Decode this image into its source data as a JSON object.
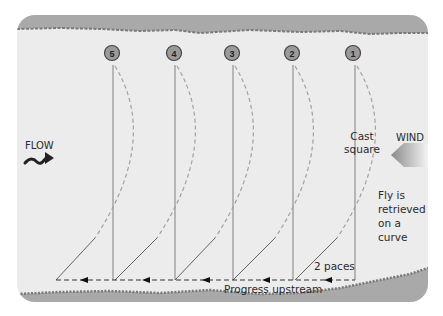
{
  "diagram": {
    "flow_label": "FLOW",
    "wind_label": "WIND",
    "cast_label_line1": "Cast",
    "cast_label_line2": "square",
    "retrieve_label_line1": "Fly is",
    "retrieve_label_line2": "retrieved",
    "retrieve_label_line3": "on a",
    "retrieve_label_line4": "curve",
    "paces_label": "2 paces",
    "progress_label": "Progress upstream",
    "positions": [
      {
        "number": "5",
        "x": 113
      },
      {
        "number": "4",
        "x": 175
      },
      {
        "number": "3",
        "x": 233
      },
      {
        "number": "2",
        "x": 293
      },
      {
        "number": "1",
        "x": 355
      }
    ],
    "colors": {
      "water": "#ececec",
      "bank": "#a9a9a9",
      "circle_fill": "#9a9a9a",
      "line": "#777777",
      "dashed": "#9a9a9a",
      "arrow": "#222222"
    }
  }
}
